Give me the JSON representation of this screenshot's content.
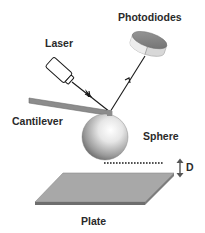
{
  "diagram": {
    "type": "AFM sphere-plate force measurement schematic",
    "labels": {
      "photodiodes": "Photodiodes",
      "laser": "Laser",
      "cantilever": "Cantilever",
      "sphere": "Sphere",
      "distance": "D",
      "plate": "Plate"
    },
    "components": [
      {
        "id": "laser",
        "icon": "laser-source-icon"
      },
      {
        "id": "laser-beam",
        "icon": "arrow-icon",
        "description": "incident beam from laser to cantilever tip"
      },
      {
        "id": "reflected-beam",
        "icon": "arrow-icon",
        "description": "reflected beam from cantilever tip to photodiodes"
      },
      {
        "id": "photodiodes",
        "icon": "photodiode-detector-icon"
      },
      {
        "id": "cantilever",
        "icon": "cantilever-beam-icon"
      },
      {
        "id": "sphere",
        "icon": "sphere-icon"
      },
      {
        "id": "separation",
        "icon": "double-arrow-icon",
        "description": "sphere-plate separation D"
      },
      {
        "id": "plate",
        "icon": "plate-icon"
      }
    ],
    "colors": {
      "line": "#1a1a1a",
      "cantilever": "#8c8c8c",
      "plate": "#a8a8a8",
      "plate_edge": "#6e6e6e",
      "photodiode": "#8a8a8a",
      "label": "#2a2a2a"
    }
  }
}
